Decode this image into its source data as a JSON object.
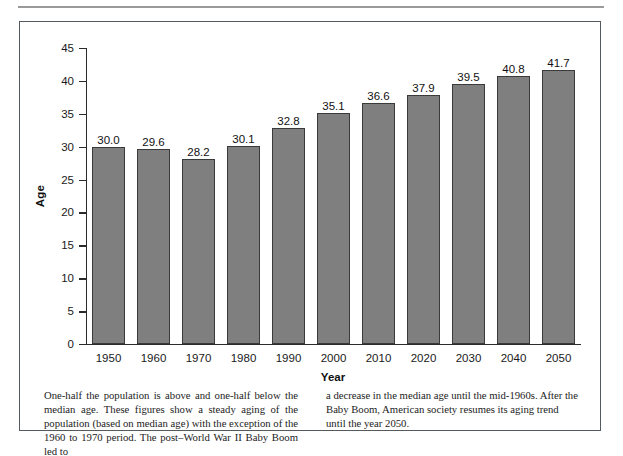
{
  "figure": {
    "y_axis_title": "Age",
    "x_axis_title": "Year"
  },
  "caption": {
    "left_column": "One-half the population is above and one-half below the median age. These figures show a steady aging of the population (based on median age) with the exception of the 1960 to 1970 period. The post–World War II Baby Boom led to",
    "right_column": "a decrease in the median age until the mid-1960s. After the Baby Boom, American society resumes its aging trend until the year 2050."
  },
  "chart_data": {
    "type": "bar",
    "title": "",
    "xlabel": "Year",
    "ylabel": "Age",
    "categories": [
      "1950",
      "1960",
      "1970",
      "1980",
      "1990",
      "2000",
      "2010",
      "2020",
      "2030",
      "2040",
      "2050"
    ],
    "values": [
      30.0,
      29.6,
      28.2,
      30.1,
      32.8,
      35.1,
      36.6,
      37.9,
      39.5,
      40.8,
      41.7
    ],
    "data_labels": [
      "30.0",
      "29.6",
      "28.2",
      "30.1",
      "32.8",
      "35.1",
      "36.6",
      "37.9",
      "39.5",
      "40.8",
      "41.7"
    ],
    "ylim": [
      0,
      45
    ],
    "yticks": [
      0,
      5,
      10,
      15,
      20,
      25,
      30,
      35,
      40,
      45
    ],
    "ytick_labels": [
      "0",
      "5",
      "10",
      "15",
      "20",
      "25",
      "30",
      "35",
      "40",
      "45"
    ],
    "grid": false,
    "legend": null,
    "bar_color": "#7f7f7f",
    "bar_edge_color": "#3a3a3a",
    "axis_color": "#2b2b2b"
  }
}
